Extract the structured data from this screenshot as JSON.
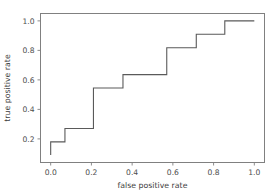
{
  "chart_data": {
    "type": "line",
    "title": "",
    "subtitle": "",
    "xlabel": "false positive rate",
    "ylabel": "true positive rate",
    "xlim": [
      -0.05,
      1.05
    ],
    "ylim": [
      0.04,
      1.05
    ],
    "grid": false,
    "legend": null,
    "drawstyle": "steps-post",
    "line_color": "#5a5a5a",
    "line_width": 1.1,
    "xticks": [
      0.0,
      0.2,
      0.4,
      0.6,
      0.8,
      1.0
    ],
    "xtick_labels": [
      "0.0",
      "0.2",
      "0.4",
      "0.6",
      "0.8",
      "1.0"
    ],
    "yticks": [
      0.2,
      0.4,
      0.6,
      0.8,
      1.0
    ],
    "ytick_labels": [
      "0.2",
      "0.4",
      "0.6",
      "0.8",
      "1.0"
    ],
    "series": [
      {
        "name": "roc-curve",
        "x": [
          0.0,
          0.0,
          0.07,
          0.07,
          0.21,
          0.21,
          0.355,
          0.355,
          0.57,
          0.57,
          0.715,
          0.715,
          0.855,
          0.855,
          1.0
        ],
        "y": [
          0.09,
          0.18,
          0.18,
          0.27,
          0.27,
          0.545,
          0.545,
          0.636,
          0.636,
          0.818,
          0.818,
          0.909,
          0.909,
          1.0,
          1.0
        ]
      }
    ]
  },
  "axes": {
    "spine_color": "#808080",
    "tick_color": "#808080",
    "background": "#ffffff"
  }
}
